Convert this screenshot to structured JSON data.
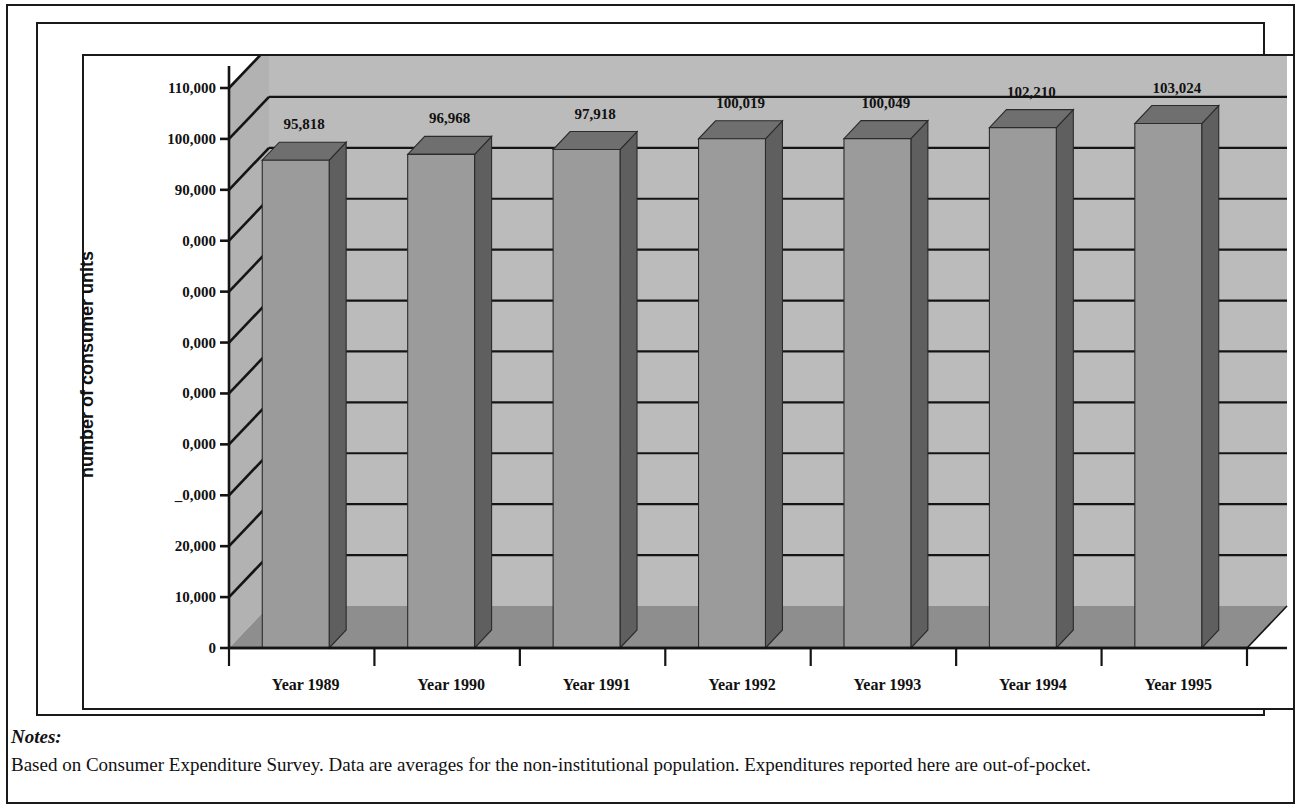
{
  "chart_data": {
    "type": "bar",
    "title": "",
    "subtitle": "",
    "xlabel": "",
    "ylabel": "number of consumer units",
    "categories": [
      "Year 1989",
      "Year 1990",
      "Year 1991",
      "Year 1992",
      "Year 1993",
      "Year 1994",
      "Year 1995"
    ],
    "values": [
      95818,
      96968,
      97918,
      100019,
      100049,
      102210,
      103024
    ],
    "value_labels": [
      "95,818",
      "96,968",
      "97,918",
      "100,019",
      "100,049",
      "102,210",
      "103,024"
    ],
    "ylim": [
      0,
      110000
    ],
    "ytick_values": [
      0,
      10000,
      20000,
      30000,
      40000,
      50000,
      60000,
      70000,
      80000,
      90000,
      100000,
      110000
    ],
    "ytick_labels": [
      "0",
      "10,000",
      "20,000",
      "_0,000",
      "0,000",
      "0,000",
      "0,000",
      "0,000",
      "0,000",
      "90,000",
      "100,000",
      "110,000"
    ],
    "grid": true,
    "grid_axis": "y",
    "legend": false,
    "legend_position": "none",
    "style": "3d-column",
    "series": [
      {
        "name": "number of consumer units",
        "values": [
          95818,
          96968,
          97918,
          100019,
          100049,
          102210,
          103024
        ]
      }
    ]
  },
  "colors": {
    "bar_front": "#9b9b9b",
    "bar_top": "#6f6f6f",
    "bar_side": "#5f5f5f",
    "back_wall": "#bbbbbb",
    "left_wall": "#b2b2b2",
    "floor": "#8e8e8e",
    "axis_line": "#141414",
    "grid_line": "#141414",
    "text": "#111111",
    "page_background": "#ffffff"
  },
  "notes": {
    "heading": "Notes:",
    "body": "Based on Consumer Expenditure Survey. Data are averages for the non-institutional population. Expenditures reported here are out-of-pocket."
  }
}
